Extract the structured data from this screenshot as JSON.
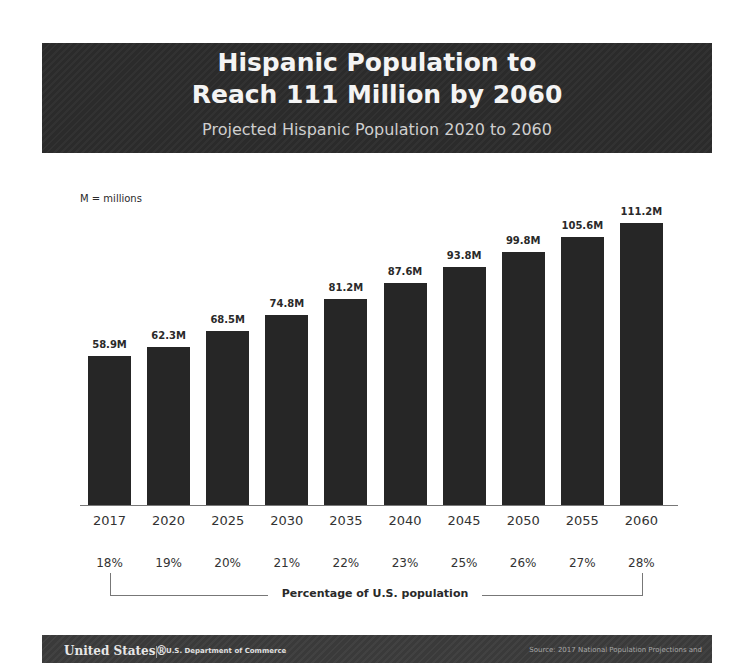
{
  "header": {
    "title_line1": "Hispanic Population to",
    "title_line2": "Reach 111 Million by 2060",
    "subtitle": "Projected Hispanic Population 2020 to 2060"
  },
  "note": "M = millions",
  "bracket_label": "Percentage of U.S. population",
  "footer": {
    "logo": "United States®",
    "department": "U.S. Department of Commerce",
    "source": "Source: 2017 National Population Projections and"
  },
  "colors": {
    "bar": "#262626",
    "header_bg": "#2b2b2b",
    "footer_bg": "#3a3a3a"
  },
  "chart_data": {
    "type": "bar",
    "title": "Hispanic Population to Reach 111 Million by 2060",
    "subtitle": "Projected Hispanic Population 2020 to 2060",
    "categories": [
      "2017",
      "2020",
      "2025",
      "2030",
      "2035",
      "2040",
      "2045",
      "2050",
      "2055",
      "2060"
    ],
    "values": [
      58.9,
      62.3,
      68.5,
      74.8,
      81.2,
      87.6,
      93.8,
      99.8,
      105.6,
      111.2
    ],
    "value_labels": [
      "58.9M",
      "62.3M",
      "68.5M",
      "74.8M",
      "81.2M",
      "87.6M",
      "93.8M",
      "99.8M",
      "105.6M",
      "111.2M"
    ],
    "percent_of_us_population": [
      "18%",
      "19%",
      "20%",
      "21%",
      "22%",
      "23%",
      "25%",
      "26%",
      "27%",
      "28%"
    ],
    "unit_note": "M = millions",
    "secondary_label": "Percentage of U.S. population",
    "xlabel": "",
    "ylabel": "",
    "ylim": [
      0,
      115
    ],
    "grid": false,
    "legend": "none"
  }
}
